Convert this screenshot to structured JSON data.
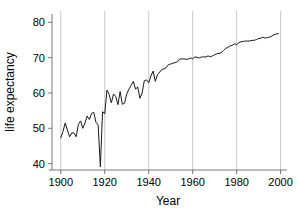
{
  "chart_data": {
    "type": "line",
    "title": "",
    "subtitle": "",
    "xlabel": "Year",
    "ylabel": "life expectancy",
    "xlim": [
      1896,
      2002
    ],
    "ylim": [
      38.2,
      81.5
    ],
    "xticks": [
      1900,
      1920,
      1940,
      1960,
      1980,
      2000
    ],
    "yticks": [
      40,
      50,
      60,
      70,
      80
    ],
    "grid": "vertical-only",
    "grid_color": "#b0b0b0",
    "line_color": "#1a1a1a",
    "line_width": 1.0,
    "legend": null,
    "legend_position": "none",
    "annotations": [],
    "x": [
      1900,
      1901,
      1902,
      1903,
      1904,
      1905,
      1906,
      1907,
      1908,
      1909,
      1910,
      1911,
      1912,
      1913,
      1914,
      1915,
      1916,
      1917,
      1918,
      1919,
      1920,
      1921,
      1922,
      1923,
      1924,
      1925,
      1926,
      1927,
      1928,
      1929,
      1930,
      1931,
      1932,
      1933,
      1934,
      1935,
      1936,
      1937,
      1938,
      1939,
      1940,
      1941,
      1942,
      1943,
      1944,
      1945,
      1946,
      1947,
      1948,
      1949,
      1950,
      1951,
      1952,
      1953,
      1954,
      1955,
      1956,
      1957,
      1958,
      1959,
      1960,
      1961,
      1962,
      1963,
      1964,
      1965,
      1966,
      1967,
      1968,
      1969,
      1970,
      1971,
      1972,
      1973,
      1974,
      1975,
      1976,
      1977,
      1978,
      1979,
      1980,
      1981,
      1982,
      1983,
      1984,
      1985,
      1986,
      1987,
      1988,
      1989,
      1990,
      1991,
      1992,
      1993,
      1994,
      1995,
      1996,
      1997,
      1998,
      1999
    ],
    "values": [
      47.3,
      49.1,
      51.5,
      49.5,
      47.6,
      48.7,
      48.7,
      47.6,
      51.1,
      52.1,
      50.0,
      51.5,
      53.5,
      52.5,
      54.2,
      54.5,
      51.7,
      50.9,
      39.1,
      54.7,
      54.1,
      60.8,
      59.6,
      57.2,
      59.7,
      59.0,
      56.7,
      60.4,
      56.8,
      57.1,
      59.7,
      61.1,
      62.1,
      63.3,
      61.1,
      61.7,
      58.5,
      60.0,
      63.5,
      63.7,
      62.9,
      64.8,
      66.2,
      63.3,
      65.2,
      65.9,
      66.7,
      66.8,
      67.2,
      68.0,
      68.2,
      68.4,
      68.6,
      68.8,
      69.6,
      69.6,
      69.7,
      69.5,
      69.6,
      69.9,
      69.7,
      70.2,
      70.1,
      69.9,
      70.2,
      70.2,
      70.2,
      70.5,
      70.2,
      70.5,
      70.8,
      71.1,
      71.2,
      71.4,
      72.0,
      72.6,
      72.9,
      73.3,
      73.5,
      73.9,
      73.7,
      74.2,
      74.5,
      74.6,
      74.7,
      74.7,
      74.7,
      74.9,
      74.9,
      75.1,
      75.4,
      75.5,
      75.8,
      75.5,
      75.7,
      75.8,
      76.1,
      76.5,
      76.7,
      76.8
    ]
  },
  "axes": {
    "x_title": "Year",
    "y_title": "life expectancy",
    "x_tick_labels": [
      "1900",
      "1920",
      "1940",
      "1960",
      "1980",
      "2000"
    ],
    "y_tick_labels": [
      "40",
      "50",
      "60",
      "70",
      "80"
    ]
  }
}
